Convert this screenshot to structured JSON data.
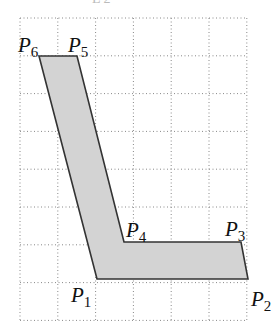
{
  "figure": {
    "top_artifact_text": "L 2",
    "grid": {
      "origin_x": 20,
      "origin_y": 18,
      "cell": 37.8,
      "cols": 6,
      "rows": 8,
      "line_color": "#888888",
      "style": "dotted"
    },
    "polygon": {
      "fill": "#d3d3d3",
      "stroke": "#333333",
      "points": [
        {
          "label": "P1",
          "x": 97,
          "y": 279
        },
        {
          "label": "P2",
          "x": 248,
          "y": 279
        },
        {
          "label": "P3",
          "x": 241,
          "y": 242
        },
        {
          "label": "P4",
          "x": 124,
          "y": 242
        },
        {
          "label": "P5",
          "x": 77,
          "y": 56
        },
        {
          "label": "P6",
          "x": 39,
          "y": 56
        }
      ]
    },
    "labels": [
      {
        "name": "P",
        "sub": "1",
        "x": 71,
        "y": 302
      },
      {
        "name": "P",
        "sub": "2",
        "x": 251,
        "y": 306
      },
      {
        "name": "P",
        "sub": "3",
        "x": 225,
        "y": 236
      },
      {
        "name": "P",
        "sub": "4",
        "x": 126,
        "y": 237
      },
      {
        "name": "P",
        "sub": "5",
        "x": 68,
        "y": 52
      },
      {
        "name": "P",
        "sub": "6",
        "x": 18,
        "y": 52
      }
    ]
  }
}
